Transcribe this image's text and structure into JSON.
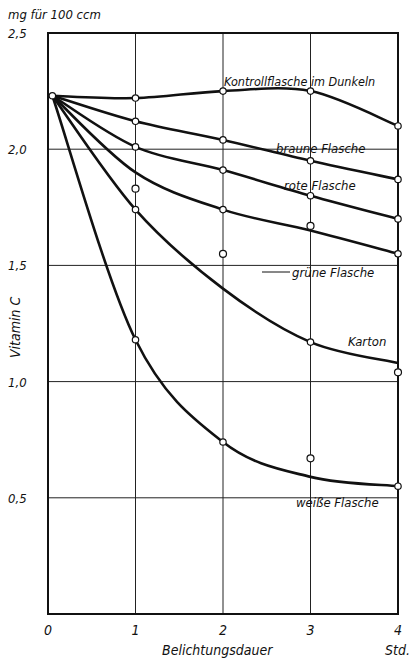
{
  "chart_data": {
    "type": "line",
    "title": "",
    "unit_label": "mg für 100 ccm",
    "xlabel": "Belichtungsdauer",
    "xunit": "Std.",
    "ylabel": "Vitamin C",
    "xlim": [
      0,
      4
    ],
    "ylim": [
      0,
      2.5
    ],
    "x_ticks": [
      "0",
      "1",
      "2",
      "3",
      "4"
    ],
    "y_ticks": [
      "0,5",
      "1,0",
      "1,5",
      "2,0",
      "2,5"
    ],
    "grid": true,
    "series": [
      {
        "name": "Kontrollflasche im Dunkeln",
        "label": "Kontrollflasche im Dunkeln",
        "x": [
          0.05,
          1,
          2,
          3,
          4
        ],
        "values": [
          2.23,
          2.22,
          2.25,
          2.25,
          2.1
        ]
      },
      {
        "name": "braune Flasche",
        "label": "braune Flasche",
        "x": [
          0.05,
          1,
          2,
          3,
          4
        ],
        "values": [
          2.23,
          2.12,
          2.04,
          1.95,
          1.87
        ]
      },
      {
        "name": "rote Flasche",
        "label": "rote Flasche",
        "x": [
          0.05,
          1,
          2,
          3,
          4
        ],
        "values": [
          2.23,
          2.01,
          1.91,
          1.8,
          1.7
        ]
      },
      {
        "name": "grüne Flasche",
        "label": "grüne Flasche",
        "x": [
          0.05,
          1,
          2,
          3,
          4
        ],
        "values": [
          2.23,
          1.9,
          1.74,
          1.65,
          1.55
        ]
      },
      {
        "name": "Karton",
        "label": "Karton",
        "x": [
          0.05,
          1,
          2,
          3,
          4
        ],
        "values": [
          2.23,
          1.74,
          1.4,
          1.17,
          1.08
        ]
      },
      {
        "name": "weiße Flasche",
        "label": "weiße Flasche",
        "x": [
          0.05,
          1,
          2,
          3,
          4
        ],
        "values": [
          2.23,
          1.18,
          0.74,
          0.59,
          0.55
        ]
      }
    ],
    "open_markers": [
      {
        "x": 1,
        "y": 1.83
      },
      {
        "x": 2,
        "y": 1.55
      },
      {
        "x": 3,
        "y": 1.67
      },
      {
        "x": 3,
        "y": 0.67
      },
      {
        "x": 4,
        "y": 1.04
      }
    ],
    "colors": {
      "line": "#111111",
      "grid": "#222222",
      "background": "#ffffff"
    }
  }
}
